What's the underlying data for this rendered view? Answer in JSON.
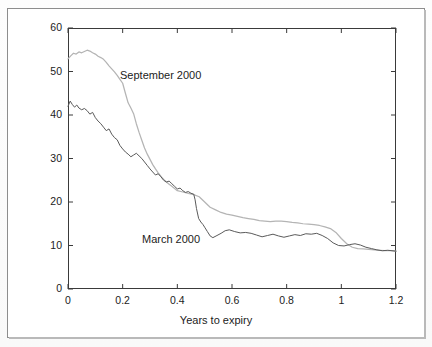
{
  "figure": {
    "background_color": "#ffffff",
    "frame_color": "#8d8d8d"
  },
  "chart_data": {
    "type": "line",
    "title": "",
    "subtitle": "",
    "xlabel": "Years to expiry",
    "ylabel": "Volatility (%)",
    "xlim": [
      0,
      1.2
    ],
    "ylim": [
      0,
      60
    ],
    "xticks": [
      "0",
      "0.2",
      "0.4",
      "0.6",
      "0.8",
      "1",
      "1.2"
    ],
    "xtick_values": [
      0,
      0.2,
      0.4,
      0.6,
      0.8,
      1.0,
      1.2
    ],
    "yticks": [
      "0",
      "10",
      "20",
      "30",
      "40",
      "50",
      "60"
    ],
    "ytick_values": [
      0,
      10,
      20,
      30,
      40,
      50,
      60
    ],
    "grid": false,
    "legend_position": "inline-annotations",
    "series": [
      {
        "name": "September 2000",
        "color": "#b4b4b4",
        "annotation": "September 2000",
        "x": [
          0.0,
          0.01,
          0.02,
          0.03,
          0.04,
          0.05,
          0.06,
          0.07,
          0.08,
          0.09,
          0.1,
          0.11,
          0.12,
          0.13,
          0.14,
          0.15,
          0.16,
          0.17,
          0.18,
          0.19,
          0.2,
          0.21,
          0.22,
          0.23,
          0.24,
          0.25,
          0.26,
          0.27,
          0.28,
          0.29,
          0.3,
          0.31,
          0.32,
          0.33,
          0.34,
          0.35,
          0.36,
          0.37,
          0.38,
          0.39,
          0.4,
          0.42,
          0.44,
          0.46,
          0.48,
          0.5,
          0.52,
          0.54,
          0.56,
          0.58,
          0.6,
          0.62,
          0.64,
          0.66,
          0.68,
          0.7,
          0.72,
          0.74,
          0.76,
          0.78,
          0.8,
          0.82,
          0.84,
          0.86,
          0.88,
          0.9,
          0.92,
          0.94,
          0.96,
          0.98,
          1.0,
          1.02,
          1.04,
          1.06,
          1.08,
          1.1,
          1.12,
          1.14,
          1.16,
          1.18,
          1.2
        ],
        "y": [
          52.9,
          53.6,
          54.2,
          54.0,
          54.5,
          54.3,
          54.6,
          54.9,
          54.7,
          54.3,
          54.0,
          53.5,
          53.2,
          52.8,
          52.1,
          51.3,
          50.6,
          49.9,
          49.1,
          48.2,
          47.3,
          45.0,
          42.8,
          41.6,
          40.3,
          38.0,
          36.0,
          34.2,
          32.4,
          31.0,
          29.8,
          28.6,
          27.6,
          26.7,
          25.9,
          25.2,
          24.6,
          24.1,
          23.6,
          23.1,
          22.6,
          22.3,
          22.0,
          21.7,
          21.2,
          20.0,
          18.8,
          18.2,
          17.6,
          17.2,
          17.0,
          16.7,
          16.4,
          16.2,
          16.0,
          15.7,
          15.6,
          15.5,
          15.6,
          15.6,
          15.5,
          15.3,
          15.2,
          15.0,
          14.9,
          14.8,
          14.6,
          14.3,
          13.9,
          13.0,
          11.6,
          10.4,
          9.6,
          9.3,
          9.2,
          9.1,
          9.0,
          8.9,
          8.8,
          8.8,
          8.7
        ]
      },
      {
        "name": "March 2000",
        "color": "#5a5a5a",
        "annotation": "March 2000",
        "x": [
          0.0,
          0.008,
          0.016,
          0.024,
          0.032,
          0.04,
          0.05,
          0.06,
          0.07,
          0.08,
          0.09,
          0.1,
          0.11,
          0.12,
          0.13,
          0.14,
          0.15,
          0.16,
          0.17,
          0.18,
          0.19,
          0.2,
          0.21,
          0.22,
          0.23,
          0.24,
          0.25,
          0.26,
          0.27,
          0.28,
          0.29,
          0.3,
          0.31,
          0.32,
          0.33,
          0.34,
          0.35,
          0.36,
          0.37,
          0.38,
          0.39,
          0.4,
          0.41,
          0.42,
          0.43,
          0.44,
          0.45,
          0.46,
          0.465,
          0.47,
          0.478,
          0.486,
          0.494,
          0.5,
          0.51,
          0.52,
          0.53,
          0.545,
          0.56,
          0.575,
          0.59,
          0.61,
          0.63,
          0.65,
          0.67,
          0.69,
          0.71,
          0.73,
          0.75,
          0.77,
          0.79,
          0.81,
          0.83,
          0.85,
          0.87,
          0.89,
          0.91,
          0.93,
          0.95,
          0.97,
          0.99,
          1.01,
          1.03,
          1.05,
          1.07,
          1.09,
          1.11,
          1.13,
          1.15,
          1.17,
          1.2
        ],
        "y": [
          42.0,
          43.2,
          42.4,
          41.8,
          42.3,
          41.6,
          41.2,
          41.5,
          41.0,
          40.2,
          40.6,
          39.4,
          38.6,
          38.0,
          37.2,
          36.4,
          36.8,
          35.6,
          34.8,
          34.3,
          33.0,
          32.2,
          31.5,
          31.0,
          30.4,
          30.8,
          31.2,
          30.6,
          30.0,
          29.2,
          28.4,
          27.6,
          26.9,
          26.2,
          26.5,
          25.8,
          25.0,
          24.6,
          24.8,
          24.2,
          23.6,
          23.0,
          23.2,
          22.6,
          22.2,
          22.4,
          22.0,
          21.8,
          20.5,
          18.5,
          16.2,
          15.4,
          14.8,
          14.2,
          13.2,
          12.2,
          11.8,
          12.3,
          12.8,
          13.4,
          13.6,
          13.2,
          12.9,
          13.0,
          12.8,
          12.4,
          12.0,
          12.3,
          12.6,
          12.2,
          11.9,
          12.2,
          12.5,
          12.3,
          12.7,
          12.6,
          12.8,
          12.3,
          11.6,
          10.6,
          10.0,
          9.9,
          10.2,
          10.4,
          10.1,
          9.6,
          9.3,
          9.0,
          8.8,
          8.9,
          8.7
        ]
      }
    ]
  }
}
